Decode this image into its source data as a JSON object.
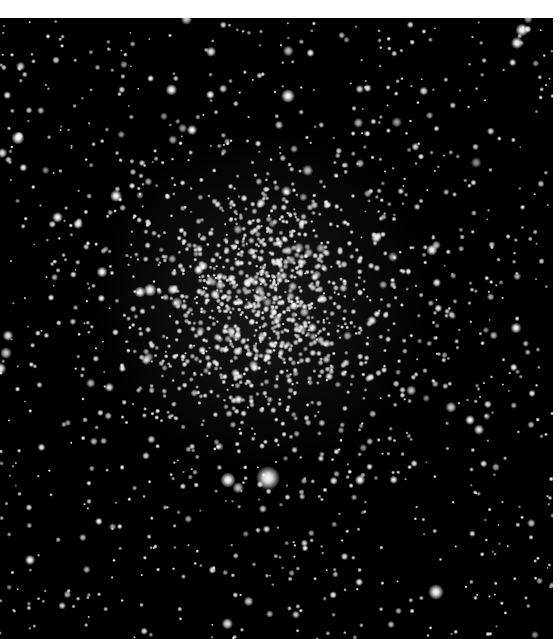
{
  "image": {
    "subject": "globular star cluster",
    "background_color": "#000000",
    "border_color": "#ffffff",
    "frame": {
      "x": 0,
      "y": 18,
      "width": 553,
      "height": 621
    },
    "cluster_center": {
      "x": 262,
      "y": 300
    },
    "cluster_core_radius": 55,
    "cluster_halo_radius": 170,
    "bright_stars": [
      {
        "x": 268,
        "y": 478,
        "r": 5.5
      },
      {
        "x": 228,
        "y": 480,
        "r": 3.5
      },
      {
        "x": 288,
        "y": 96,
        "r": 3.2
      },
      {
        "x": 18,
        "y": 138,
        "r": 3.0
      },
      {
        "x": 522,
        "y": 30,
        "r": 3.0
      },
      {
        "x": 517,
        "y": 43,
        "r": 2.8
      },
      {
        "x": 436,
        "y": 592,
        "r": 3.6
      },
      {
        "x": 150,
        "y": 290,
        "r": 3.0
      },
      {
        "x": 140,
        "y": 292,
        "r": 2.6
      },
      {
        "x": 116,
        "y": 196,
        "r": 2.8
      },
      {
        "x": 432,
        "y": 250,
        "r": 2.6
      },
      {
        "x": 516,
        "y": 328,
        "r": 2.5
      },
      {
        "x": 102,
        "y": 272,
        "r": 2.5
      },
      {
        "x": 192,
        "y": 130,
        "r": 2.4
      },
      {
        "x": 360,
        "y": 480,
        "r": 2.4
      },
      {
        "x": 78,
        "y": 224,
        "r": 2.3
      },
      {
        "x": 470,
        "y": 420,
        "r": 2.3
      },
      {
        "x": 30,
        "y": 560,
        "r": 2.4
      }
    ],
    "field_star_count": 900,
    "cluster_star_count": 1100
  }
}
